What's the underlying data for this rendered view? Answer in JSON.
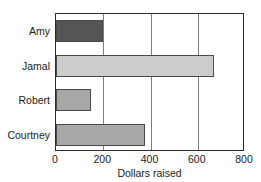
{
  "chart_data": {
    "type": "bar",
    "orientation": "horizontal",
    "title": "",
    "xlabel": "Dollars raised",
    "ylabel": "",
    "categories": [
      "Amy",
      "Jamal",
      "Robert",
      "Courtney"
    ],
    "values": [
      200,
      670,
      150,
      375
    ],
    "xlim": [
      0,
      800
    ],
    "xticks": [
      0,
      200,
      400,
      600,
      800
    ],
    "xtick_labels": [
      "0",
      "200",
      "400",
      "600",
      "800"
    ],
    "grid": "vertical",
    "legend": "none",
    "bar_colors": [
      "#555555",
      "#cccccc",
      "#a8a8a8",
      "#a8a8a8"
    ],
    "bar_edge_color": "#4a4a4a",
    "frame_color": "#2b2b2b",
    "gridline_color": "#7d7d7d",
    "background": "#ffffff"
  }
}
